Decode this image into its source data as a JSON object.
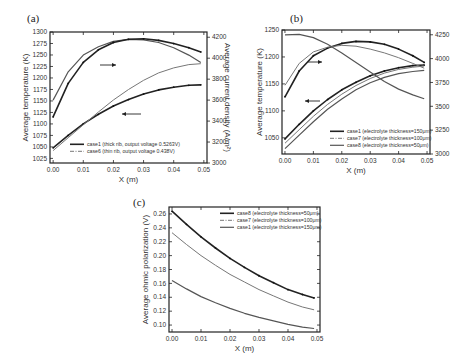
{
  "chart_data": [
    {
      "panel": "(a)",
      "type": "line",
      "title": "",
      "xlabel": "X (m)",
      "ylabel": "Average temperature (K)",
      "y2label": "Average current density (A/m²)",
      "xlim": [
        0,
        0.05
      ],
      "ylim": [
        1015,
        1300
      ],
      "y2lim": [
        3000,
        4250
      ],
      "xticks": [
        "0.00",
        "0.01",
        "0.02",
        "0.03",
        "0.04",
        "0.05"
      ],
      "yticks": [
        "1025",
        "1050",
        "1075",
        "1100",
        "1125",
        "1150",
        "1175",
        "1200",
        "1225",
        "1250",
        "1275",
        "1300"
      ],
      "y2ticks": [
        "3000",
        "3200",
        "3400",
        "3600",
        "3800",
        "4000",
        "4200"
      ],
      "legend": [
        "case1 (thick rib, output voltage 0.5263V)",
        "case6 (thin rib, output voltage 0.438V)"
      ],
      "legend_position": "lower right",
      "annotations": [
        "arrow → right axis (current density curves)",
        "arrow ← left axis (temperature curves)"
      ],
      "x": [
        0.0,
        0.005,
        0.01,
        0.015,
        0.02,
        0.025,
        0.03,
        0.035,
        0.04,
        0.045,
        0.049
      ],
      "series": [
        {
          "name": "case1 temperature",
          "axis": "left",
          "values": [
            1048,
            1075,
            1100,
            1121,
            1139,
            1153,
            1165,
            1174,
            1180,
            1184,
            1185
          ]
        },
        {
          "name": "case6 temperature",
          "axis": "left",
          "values": [
            1042,
            1070,
            1098,
            1126,
            1152,
            1175,
            1195,
            1211,
            1222,
            1229,
            1231
          ]
        },
        {
          "name": "case1 current density",
          "axis": "right",
          "values": [
            3600,
            3870,
            4030,
            4110,
            4160,
            4180,
            4175,
            4150,
            4100,
            4030,
            3960
          ]
        },
        {
          "name": "case6 current density",
          "axis": "right",
          "values": [
            3440,
            3760,
            3960,
            4080,
            4150,
            4180,
            4185,
            4170,
            4140,
            4100,
            4060
          ]
        }
      ]
    },
    {
      "panel": "(b)",
      "type": "line",
      "title": "",
      "xlabel": "X (m)",
      "ylabel": "Average temperature (K)",
      "y2label": "",
      "xlim": [
        0,
        0.05
      ],
      "ylim": [
        1020,
        1250
      ],
      "y2lim": [
        3000,
        4300
      ],
      "xticks": [
        "0.00",
        "0.01",
        "0.02",
        "0.03",
        "0.04",
        "0.05"
      ],
      "yticks": [
        "1050",
        "1100",
        "1150",
        "1200",
        "1250"
      ],
      "y2ticks": [
        "3000",
        "3250",
        "3500",
        "3750",
        "4000",
        "4250"
      ],
      "legend": [
        "case1 (electrolyte thickness=150μm)",
        "case7 (electrolyte thickness=100μm)",
        "case8 (electrolyte thickness=50μm)"
      ],
      "legend_position": "lower right",
      "annotations": [
        "arrow → right axis",
        "arrow ← left axis"
      ],
      "x": [
        0.0,
        0.005,
        0.01,
        0.015,
        0.02,
        0.025,
        0.03,
        0.035,
        0.04,
        0.045,
        0.049
      ],
      "series": [
        {
          "name": "case1 temperature",
          "axis": "left",
          "values": [
            1048,
            1075,
            1100,
            1121,
            1139,
            1153,
            1165,
            1174,
            1180,
            1184,
            1185
          ]
        },
        {
          "name": "case7 temperature",
          "axis": "left",
          "values": [
            1040,
            1065,
            1090,
            1112,
            1131,
            1147,
            1160,
            1170,
            1177,
            1181,
            1183
          ]
        },
        {
          "name": "case8 temperature",
          "axis": "left",
          "values": [
            1030,
            1055,
            1080,
            1103,
            1122,
            1139,
            1152,
            1162,
            1169,
            1173,
            1175
          ]
        },
        {
          "name": "case1 current density",
          "axis": "right",
          "values": [
            3600,
            3870,
            4030,
            4110,
            4160,
            4180,
            4175,
            4150,
            4100,
            4030,
            3960
          ]
        },
        {
          "name": "case7 current density",
          "axis": "right",
          "values": [
            3720,
            3950,
            4070,
            4120,
            4140,
            4130,
            4100,
            4060,
            4010,
            3950,
            3900
          ]
        },
        {
          "name": "case8 current density",
          "axis": "right",
          "values": [
            4250,
            4255,
            4220,
            4150,
            4060,
            3960,
            3860,
            3760,
            3680,
            3620,
            3580
          ]
        }
      ]
    },
    {
      "panel": "(c)",
      "type": "line",
      "title": "",
      "xlabel": "X (m)",
      "ylabel": "Average ohmic polarization (V)",
      "xlim": [
        0,
        0.05
      ],
      "ylim": [
        0.09,
        0.27
      ],
      "xticks": [
        "0.00",
        "0.01",
        "0.02",
        "0.03",
        "0.04",
        "0.05"
      ],
      "yticks": [
        "0.10",
        "0.12",
        "0.14",
        "0.16",
        "0.18",
        "0.20",
        "0.22",
        "0.24",
        "0.26"
      ],
      "legend": [
        "case8 (electrolyte thickness=50μm)",
        "case7 (electrolyte thickness=100μm)",
        "case1 (electrolyte thickness=150μm)"
      ],
      "legend_position": "upper right",
      "x": [
        0.0,
        0.005,
        0.01,
        0.015,
        0.02,
        0.025,
        0.03,
        0.035,
        0.04,
        0.045,
        0.049
      ],
      "series": [
        {
          "name": "case1",
          "values": [
            0.264,
            0.245,
            0.227,
            0.211,
            0.196,
            0.183,
            0.171,
            0.161,
            0.151,
            0.144,
            0.139
          ]
        },
        {
          "name": "case7",
          "values": [
            0.233,
            0.216,
            0.2,
            0.186,
            0.173,
            0.162,
            0.151,
            0.142,
            0.133,
            0.126,
            0.122
          ]
        },
        {
          "name": "case8",
          "values": [
            0.164,
            0.152,
            0.141,
            0.132,
            0.124,
            0.117,
            0.111,
            0.106,
            0.101,
            0.097,
            0.095
          ]
        }
      ]
    }
  ]
}
